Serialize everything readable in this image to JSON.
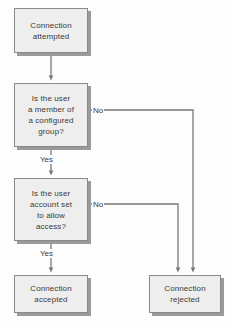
{
  "diagram": {
    "background_color": "#fdfdfd",
    "node_fill_color": "#eeeeee",
    "node_border_color": "#8a8a8a",
    "node_shadow_color": "#9a9a9a",
    "connector_color": "#7a7a7a",
    "text_color": "#3a3a3a",
    "nodes": [
      {
        "id": "connection-attempted",
        "label": "Connection\nattempted",
        "type": "terminator",
        "x": 14,
        "y": 8,
        "width": 74,
        "height": 45
      },
      {
        "id": "member-of-group",
        "label": "Is the user\na member of\na configured\ngroup?",
        "type": "decision",
        "x": 14,
        "y": 83,
        "width": 74,
        "height": 64
      },
      {
        "id": "account-allow-access",
        "label": "Is the user\naccount set\nto allow\naccess?",
        "type": "decision",
        "x": 14,
        "y": 178,
        "width": 74,
        "height": 63
      },
      {
        "id": "connection-accepted",
        "label": "Connection\naccepted",
        "type": "terminator",
        "x": 14,
        "y": 275,
        "width": 74,
        "height": 38
      },
      {
        "id": "connection-rejected",
        "label": "Connection\nrejected",
        "type": "terminator",
        "x": 149,
        "y": 275,
        "width": 72,
        "height": 38
      }
    ],
    "edge_labels": [
      {
        "id": "group-no",
        "text": "No",
        "x": 92,
        "y": 106
      },
      {
        "id": "group-yes",
        "text": "Yes",
        "x": 39,
        "y": 155
      },
      {
        "id": "account-no",
        "text": "No",
        "x": 92,
        "y": 200
      },
      {
        "id": "account-yes",
        "text": "Yes",
        "x": 39,
        "y": 249
      }
    ],
    "edges": [
      {
        "id": "attempted-to-group",
        "from": "connection-attempted",
        "to": "member-of-group",
        "label": ""
      },
      {
        "id": "group-yes-to-account",
        "from": "member-of-group",
        "to": "account-allow-access",
        "label": "Yes"
      },
      {
        "id": "group-no-to-rejected",
        "from": "member-of-group",
        "to": "connection-rejected",
        "label": "No"
      },
      {
        "id": "account-yes-to-accepted",
        "from": "account-allow-access",
        "to": "connection-accepted",
        "label": "Yes"
      },
      {
        "id": "account-no-to-rejected",
        "from": "account-allow-access",
        "to": "connection-rejected",
        "label": "No"
      }
    ]
  }
}
